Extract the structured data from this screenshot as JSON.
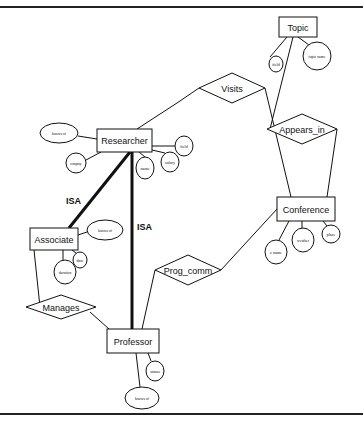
{
  "diagram": {
    "type": "er-diagram",
    "entities": [
      {
        "id": "topic",
        "label": "Topic",
        "x": 279,
        "y": 17,
        "w": 38,
        "h": 20
      },
      {
        "id": "researcher",
        "label": "Researcher",
        "x": 97,
        "y": 129,
        "w": 55,
        "h": 23
      },
      {
        "id": "associate",
        "label": "Associate",
        "x": 30,
        "y": 228,
        "w": 48,
        "h": 22
      },
      {
        "id": "conference",
        "label": "Conference",
        "x": 277,
        "y": 197,
        "w": 58,
        "h": 24
      },
      {
        "id": "professor",
        "label": "Professor",
        "x": 107,
        "y": 329,
        "w": 52,
        "h": 24
      }
    ],
    "relationships": [
      {
        "id": "visits",
        "label": "Visits",
        "cx": 232,
        "cy": 88,
        "hw": 33,
        "hh": 15
      },
      {
        "id": "appears_in",
        "label": "Appears_in",
        "cx": 302,
        "cy": 129,
        "hw": 35,
        "hh": 15
      },
      {
        "id": "prog_comm",
        "label": "Prog_comm",
        "cx": 188,
        "cy": 270,
        "hw": 33,
        "hh": 15
      },
      {
        "id": "manages",
        "label": "Manages",
        "cx": 61,
        "cy": 307,
        "hw": 35,
        "hh": 12
      }
    ],
    "attributes": [
      {
        "id": "topic-field",
        "label": "field",
        "cx": 276,
        "cy": 64,
        "rx": 7,
        "ry": 8
      },
      {
        "id": "topic-name",
        "label": "topic name",
        "cx": 317,
        "cy": 56,
        "rx": 14,
        "ry": 14
      },
      {
        "id": "researcher-knows-of",
        "label": "knows of",
        "cx": 59,
        "cy": 133,
        "rx": 19,
        "ry": 10
      },
      {
        "id": "researcher-cmpny",
        "label": "cmpny",
        "cx": 76,
        "cy": 163,
        "rx": 10,
        "ry": 10
      },
      {
        "id": "researcher-name",
        "label": "name",
        "cx": 145,
        "cy": 168,
        "rx": 9,
        "ry": 11
      },
      {
        "id": "researcher-salary",
        "label": "salary",
        "cx": 170,
        "cy": 162,
        "rx": 9,
        "ry": 10
      },
      {
        "id": "researcher-field",
        "label": "field",
        "cx": 184,
        "cy": 146,
        "rx": 9,
        "ry": 10
      },
      {
        "id": "associate-knows-of",
        "label": "knows of",
        "cx": 105,
        "cy": 230,
        "rx": 18,
        "ry": 10
      },
      {
        "id": "associate-date",
        "label": "date",
        "cx": 80,
        "cy": 260,
        "rx": 7,
        "ry": 8
      },
      {
        "id": "associate-duration",
        "label": "duration",
        "cx": 65,
        "cy": 272,
        "rx": 11,
        "ry": 12
      },
      {
        "id": "conference-c-name",
        "label": "c name",
        "cx": 276,
        "cy": 252,
        "rx": 11,
        "ry": 12
      },
      {
        "id": "conference-weather",
        "label": "weather",
        "cx": 303,
        "cy": 240,
        "rx": 11,
        "ry": 12
      },
      {
        "id": "conference-place",
        "label": "place",
        "cx": 331,
        "cy": 234,
        "rx": 9,
        "ry": 9
      },
      {
        "id": "professor-status",
        "label": "status",
        "cx": 155,
        "cy": 371,
        "rx": 9,
        "ry": 10
      },
      {
        "id": "professor-knows-of",
        "label": "knows of",
        "cx": 142,
        "cy": 398,
        "rx": 17,
        "ry": 11
      }
    ],
    "edges": [
      {
        "from": [
          287,
          37
        ],
        "to": [
          270,
          57
        ],
        "w": 1
      },
      {
        "from": [
          298,
          37
        ],
        "to": [
          309,
          45
        ],
        "w": 1
      },
      {
        "from": [
          293,
          37
        ],
        "to": [
          270,
          129
        ],
        "w": 1
      },
      {
        "from": [
          177,
          103
        ],
        "to": [
          199,
          88
        ],
        "w": 1
      },
      {
        "from": [
          137,
          129
        ],
        "to": [
          177,
          103
        ],
        "w": 1
      },
      {
        "from": [
          265,
          88
        ],
        "to": [
          291,
          197
        ],
        "w": 1
      },
      {
        "from": [
          337,
          129
        ],
        "to": [
          327,
          197
        ],
        "w": 1
      },
      {
        "from": [
          78,
          136
        ],
        "to": [
          97,
          139
        ],
        "w": 1
      },
      {
        "from": [
          86,
          160
        ],
        "to": [
          101,
          152
        ],
        "w": 1
      },
      {
        "from": [
          139,
          152
        ],
        "to": [
          145,
          157
        ],
        "w": 1
      },
      {
        "from": [
          152,
          150
        ],
        "to": [
          165,
          153
        ],
        "w": 1
      },
      {
        "from": [
          152,
          146
        ],
        "to": [
          175,
          146
        ],
        "w": 1
      },
      {
        "from": [
          130,
          152
        ],
        "to": [
          69,
          228
        ],
        "w": 3
      },
      {
        "from": [
          132,
          152
        ],
        "to": [
          132,
          329
        ],
        "w": 3
      },
      {
        "from": [
          78,
          235
        ],
        "to": [
          87,
          232
        ],
        "w": 1
      },
      {
        "from": [
          63,
          250
        ],
        "to": [
          63,
          261
        ],
        "w": 1
      },
      {
        "from": [
          72,
          250
        ],
        "to": [
          76,
          253
        ],
        "w": 1
      },
      {
        "from": [
          34,
          250
        ],
        "to": [
          40,
          307
        ],
        "w": 1
      },
      {
        "from": [
          90,
          312
        ],
        "to": [
          109,
          329
        ],
        "w": 1
      },
      {
        "from": [
          155,
          270
        ],
        "to": [
          142,
          329
        ],
        "w": 1
      },
      {
        "from": [
          221,
          270
        ],
        "to": [
          277,
          209
        ],
        "w": 1
      },
      {
        "from": [
          289,
          221
        ],
        "to": [
          279,
          240
        ],
        "w": 1
      },
      {
        "from": [
          302,
          221
        ],
        "to": [
          302,
          228
        ],
        "w": 1
      },
      {
        "from": [
          323,
          221
        ],
        "to": [
          327,
          226
        ],
        "w": 1
      },
      {
        "from": [
          148,
          353
        ],
        "to": [
          151,
          361
        ],
        "w": 1
      },
      {
        "from": [
          136,
          353
        ],
        "to": [
          140,
          387
        ],
        "w": 1
      }
    ],
    "isa_labels": [
      {
        "id": "isa-associate",
        "label": "ISA",
        "x": 66,
        "y": 204
      },
      {
        "id": "isa-professor",
        "label": "ISA",
        "x": 137,
        "y": 230
      }
    ],
    "frame": {
      "top_y": 7,
      "bottom_y": 414
    }
  }
}
